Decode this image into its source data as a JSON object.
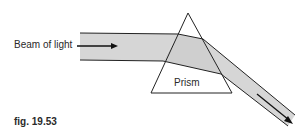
{
  "figure": {
    "beam_label": "Beam of light",
    "prism_label": "Prism",
    "caption": "fig. 19.53",
    "beam_color": "#d6d6d6",
    "line_color": "#222222"
  }
}
